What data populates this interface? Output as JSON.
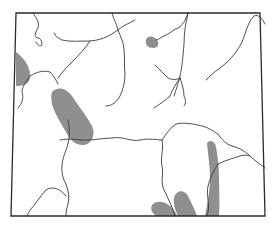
{
  "map": {
    "subject": "Wyoming state outline with rivers and shaded distribution areas",
    "colors": {
      "background": "#ffffff",
      "border": "#2a2a2a",
      "river": "#3a3a3a",
      "shaded_area": "#8f8f8f"
    },
    "state_outline": "M16,13 L260,13 L265,216 L11,216 Z",
    "shaded_areas": [
      {
        "name": "west-edge-area",
        "path": "M16,52 C24,58 30,66 30,76 C30,84 24,86 16,86 Z"
      },
      {
        "name": "central-west-ridge",
        "path": "M52,92 C58,86 66,88 72,96 C80,108 88,118 92,126 C96,134 92,144 84,145 C76,146 70,140 66,132 C60,122 54,112 52,104 C51,99 51,95 52,92 Z"
      },
      {
        "name": "north-central-spot",
        "path": "M146,40 C148,35 154,36 157,40 C160,44 158,48 153,48 C148,48 145,45 146,40 Z"
      },
      {
        "name": "southeast-ridge",
        "path": "M207,143 C210,139 215,141 216,147 C218,158 219,168 219,178 C219,192 220,204 219,216 L205,216 C207,204 210,192 210,180 C210,166 208,154 207,143 Z"
      },
      {
        "name": "south-lobe-east",
        "path": "M174,198 C176,190 184,189 188,196 C192,204 195,210 197,216 L178,216 C175,210 173,204 174,198 Z"
      },
      {
        "name": "south-lobe-west",
        "path": "M152,205 C156,200 164,201 170,206 C174,209 176,213 177,216 L156,216 C152,213 150,209 152,205 Z"
      }
    ],
    "rivers": [
      {
        "name": "northwest-river",
        "path": "M33,13 C36,18 40,22 38,28 C35,33 34,36 37,38 C40,37 42,41 42,45 C40,47 37,45 36,42"
      },
      {
        "name": "upper-west-river",
        "path": "M54,33 C55,36 58,38 62,40 C70,42 80,41 90,41 C104,40 112,34 118,30 C122,26 128,24 135,20"
      },
      {
        "name": "main-north-river",
        "path": "M112,13 C113,18 116,22 118,30 C120,36 124,42 124,50 C125,58 124,66 125,74 C125,82 123,90 120,96 C117,102 112,106 106,106"
      },
      {
        "name": "diagonal-central-river",
        "path": "M90,41 C84,50 78,56 72,62 C66,68 62,72 58,78"
      },
      {
        "name": "west-connector-river",
        "path": "M30,76 C36,72 44,70 50,72 C54,76 56,80 58,84"
      },
      {
        "name": "west-south-river",
        "path": "M30,76 C26,82 22,86 22,92 C24,98 22,104 18,108"
      },
      {
        "name": "upper-right-river",
        "path": "M188,13 C186,20 182,26 178,28 C172,30 170,34 164,36 C160,38 158,40 156,40"
      },
      {
        "name": "central-north-south-river",
        "path": "M188,13 C186,22 184,32 184,44 C183,56 182,68 180,76 C178,84 176,90 174,96"
      },
      {
        "name": "tributary-west",
        "path": "M155,65 C160,70 164,74 168,78 C172,80 176,80 180,78"
      },
      {
        "name": "tributary-fork-south",
        "path": "M180,78 C182,84 184,90 184,96 C186,100 186,104 184,106"
      },
      {
        "name": "tributary-fork-left",
        "path": "M180,78 C176,84 172,90 170,96 C166,100 160,104 154,108"
      },
      {
        "name": "northeast-river",
        "path": "M265,24 C262,18 258,14 254,16 C248,22 246,32 242,42 C236,54 228,62 220,68 C214,72 210,76 206,80"
      },
      {
        "name": "central-long-river",
        "path": "M60,140 C70,138 78,140 86,140 C96,140 104,138 112,138 C124,136 130,142 140,140 C150,138 156,140 162,140"
      },
      {
        "name": "south-central-vertical",
        "path": "M162,140 C166,134 170,128 176,124 C184,122 194,124 202,126 C210,128 214,132 218,134"
      },
      {
        "name": "east-upper-ridge-river",
        "path": "M218,134 C222,140 226,144 232,146 C240,148 246,152 250,156 C254,160 260,164 265,168"
      },
      {
        "name": "east-lower-river",
        "path": "M218,164 C226,160 234,158 240,156 C246,154 250,156 250,156"
      },
      {
        "name": "southeast-vertical-river",
        "path": "M218,164 C214,170 210,178 208,186 C206,196 210,204 208,212 C207,214 207,216 207,216"
      },
      {
        "name": "south-middle-river",
        "path": "M162,140 C164,150 160,158 162,166 C164,174 160,182 164,190 C168,198 172,206 175,216"
      },
      {
        "name": "southwest-river",
        "path": "M68,120 C70,130 70,140 66,150 C62,160 60,170 64,180 C68,188 70,196 68,204 C66,210 66,214 66,216"
      },
      {
        "name": "southwest-loop-river",
        "path": "M66,196 C60,188 52,186 46,190 C40,196 36,204 30,210 C28,214 27,216 27,216"
      }
    ]
  }
}
